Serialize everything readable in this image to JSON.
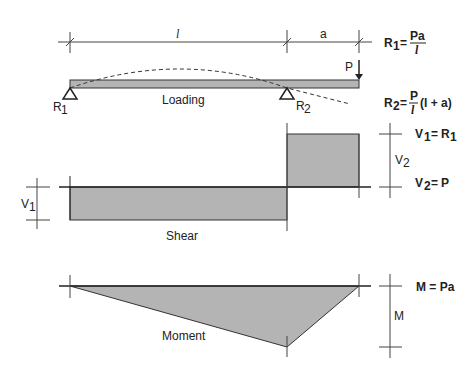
{
  "dimensions": {
    "span_label": "l",
    "overhang_label": "a"
  },
  "loading": {
    "title": "Loading",
    "load_label": "P",
    "support_left": "R",
    "support_left_sub": "1",
    "support_right": "R",
    "support_right_sub": "2"
  },
  "formulas": {
    "r1_lhs": "R",
    "r1_sub": "1",
    "r1_num": "Pa",
    "r1_den": "l",
    "r2_lhs": "R",
    "r2_sub": "2",
    "r2_num": "P",
    "r2_den": "l",
    "r2_tail": "(l + a)",
    "v1_lhs": "V",
    "v1_sub": "1",
    "v1_rhs": "R",
    "v1_rhs_sub": "1",
    "v2_lhs": "V",
    "v2_sub": "2",
    "v2_rhs": "P",
    "m_text": "M = Pa"
  },
  "shear": {
    "title": "Shear",
    "v1_label": "V",
    "v1_sub": "1",
    "v2_label": "V",
    "v2_sub": "2"
  },
  "moment": {
    "title": "Moment",
    "m_label": "M"
  },
  "colors": {
    "fill": "#b4b4b4",
    "stroke": "#222222"
  }
}
